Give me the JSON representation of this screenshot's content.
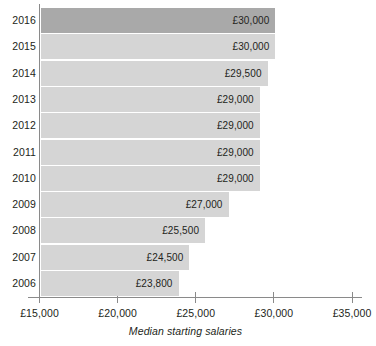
{
  "chart_data": {
    "type": "bar",
    "orientation": "horizontal",
    "title": "",
    "subtitle": "",
    "xlabel": "Median starting salaries",
    "ylabel": "",
    "xlim": [
      15000,
      35000
    ],
    "xtick_values": [
      15000,
      20000,
      25000,
      30000,
      35000
    ],
    "xtick_labels": [
      "£15,000",
      "£20,000",
      "£25,000",
      "£30,000",
      "£35,000"
    ],
    "grid": false,
    "legend": null,
    "categories": [
      "2016",
      "2015",
      "2014",
      "2013",
      "2012",
      "2011",
      "2010",
      "2009",
      "2008",
      "2007",
      "2006"
    ],
    "values": [
      30000,
      30000,
      29500,
      29000,
      29000,
      29000,
      29000,
      27000,
      25500,
      24500,
      23800
    ],
    "value_labels": [
      "£30,000",
      "£30,000",
      "£29,500",
      "£29,000",
      "£29,000",
      "£29,000",
      "£29,000",
      "£27,000",
      "£25,500",
      "£24,500",
      "£23,800"
    ],
    "bar_colors": [
      "#a9a9a9",
      "#d5d5d5",
      "#d5d5d5",
      "#d5d5d5",
      "#d5d5d5",
      "#d5d5d5",
      "#d5d5d5",
      "#d5d5d5",
      "#d5d5d5",
      "#d5d5d5",
      "#d5d5d5"
    ],
    "highlight_category": "2016",
    "colors": {
      "background": "#ffffff",
      "bar_default": "#d5d5d5",
      "bar_highlight": "#a9a9a9",
      "axis": "#8a8a8a",
      "text": "#231f20"
    }
  }
}
